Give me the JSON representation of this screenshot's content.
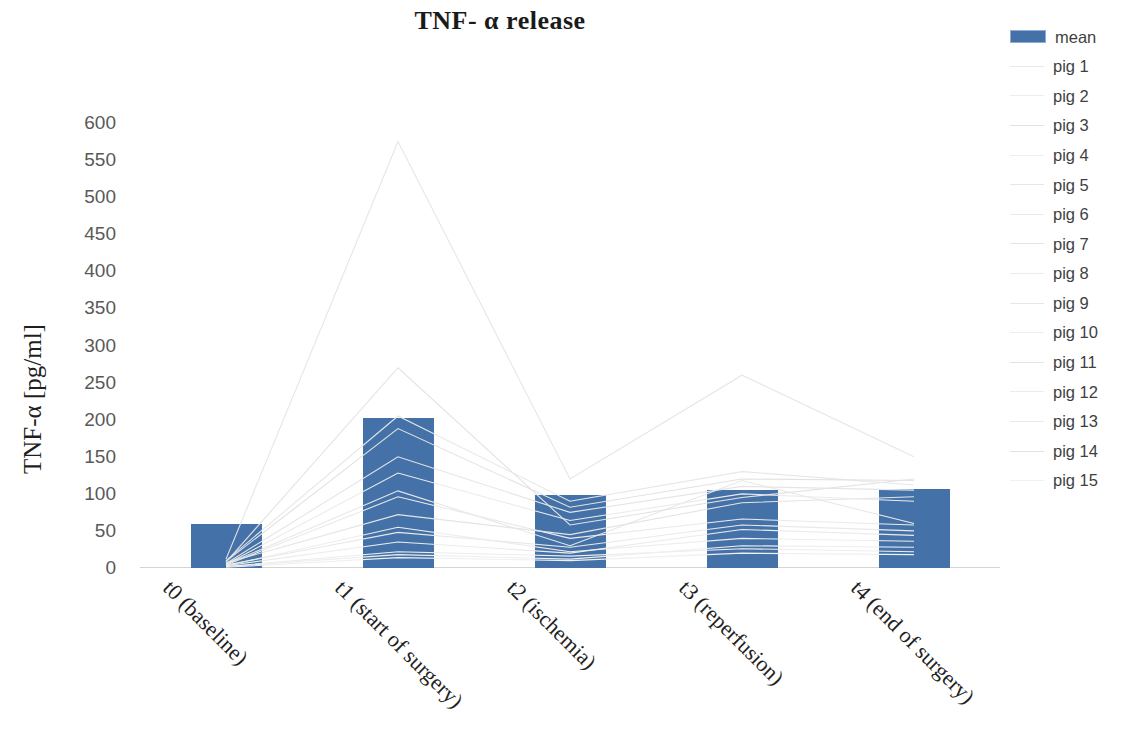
{
  "chart_data": {
    "type": "bar",
    "title": "TNF- α release",
    "xlabel": "",
    "ylabel": "TNF-α [pg/ml]",
    "ylim": [
      0,
      600
    ],
    "ytick_step": 50,
    "yticks": [
      0,
      50,
      100,
      150,
      200,
      250,
      300,
      350,
      400,
      450,
      500,
      550,
      600
    ],
    "grid": false,
    "legend_position": "right",
    "categories": [
      "t0 (baseline)",
      "t1 (start of surgery)",
      "t2 (ischemia)",
      "t3 (reperfusion)",
      "t4 (end of surgery)"
    ],
    "bar_series": {
      "name": "mean",
      "color": "#4472a8",
      "values": [
        59,
        202,
        99,
        105,
        106
      ]
    },
    "line_series": [
      {
        "name": "pig 1",
        "color": "#e8e8e8",
        "values": [
          5,
          104,
          30,
          118,
          60
        ]
      },
      {
        "name": "pig 2",
        "color": "#ededed",
        "values": [
          3,
          55,
          22,
          40,
          36
        ]
      },
      {
        "name": "pig 3",
        "color": "#e3e3e3",
        "values": [
          8,
          270,
          58,
          95,
          120
        ]
      },
      {
        "name": "pig 4",
        "color": "#efefef",
        "values": [
          2,
          18,
          12,
          30,
          28
        ]
      },
      {
        "name": "pig 5",
        "color": "#e6e6e6",
        "values": [
          12,
          575,
          120,
          260,
          150
        ]
      },
      {
        "name": "pig 6",
        "color": "#eaeaea",
        "values": [
          4,
          96,
          40,
          66,
          58
        ]
      },
      {
        "name": "pig 7",
        "color": "#e5e5e5",
        "values": [
          6,
          150,
          75,
          110,
          105
        ]
      },
      {
        "name": "pig 8",
        "color": "#ececec",
        "values": [
          3,
          35,
          20,
          52,
          44
        ]
      },
      {
        "name": "pig 9",
        "color": "#e7e7e7",
        "values": [
          10,
          205,
          90,
          130,
          112
        ]
      },
      {
        "name": "pig 10",
        "color": "#eeeeee",
        "values": [
          2,
          22,
          16,
          26,
          22
        ]
      },
      {
        "name": "pig 11",
        "color": "#e4e4e4",
        "values": [
          7,
          72,
          45,
          88,
          96
        ]
      },
      {
        "name": "pig 12",
        "color": "#ebebeb",
        "values": [
          5,
          128,
          64,
          100,
          90
        ]
      },
      {
        "name": "pig 13",
        "color": "#e9e9e9",
        "values": [
          4,
          48,
          28,
          58,
          50
        ]
      },
      {
        "name": "pig 14",
        "color": "#e2e2e2",
        "values": [
          9,
          188,
          82,
          120,
          118
        ]
      },
      {
        "name": "pig 15",
        "color": "#f0f0f0",
        "values": [
          1,
          14,
          10,
          20,
          18
        ]
      }
    ]
  },
  "legend": {
    "entries": [
      "mean",
      "pig 1",
      "pig 2",
      "pig 3",
      "pig 4",
      "pig 5",
      "pig 6",
      "pig 7",
      "pig 8",
      "pig 9",
      "pig 10",
      "pig 11",
      "pig 12",
      "pig 13",
      "pig 14",
      "pig 15"
    ]
  }
}
